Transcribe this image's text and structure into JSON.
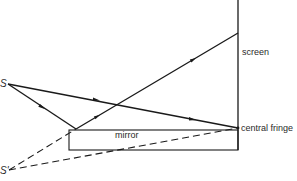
{
  "diagram": {
    "type": "Lloyd's mirror interference",
    "labels": {
      "source": "S",
      "virtual_source": "S'",
      "screen": "screen",
      "mirror": "mirror",
      "central_fringe": "central fringe"
    },
    "colors": {
      "line": "#1a1a1a",
      "text": "#2a2a2a",
      "background": "#ffffff"
    }
  }
}
